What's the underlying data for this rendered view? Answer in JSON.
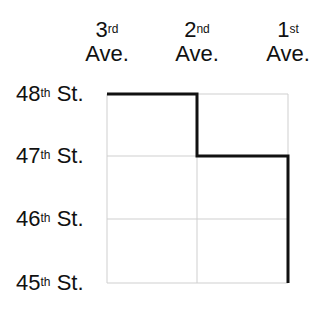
{
  "diagram": {
    "avenues": [
      {
        "num": "3",
        "suffix": "rd",
        "label": "Ave.",
        "x": 107
      },
      {
        "num": "2",
        "suffix": "nd",
        "label": "Ave.",
        "x": 197
      },
      {
        "num": "1",
        "suffix": "st",
        "label": "Ave.",
        "x": 288
      }
    ],
    "streets": [
      {
        "num": "48",
        "suffix": "th",
        "label": "St.",
        "y": 94
      },
      {
        "num": "47",
        "suffix": "th",
        "label": "St.",
        "y": 156
      },
      {
        "num": "46",
        "suffix": "th",
        "label": "St.",
        "y": 219
      },
      {
        "num": "45",
        "suffix": "th",
        "label": "St.",
        "y": 283
      }
    ],
    "route": {
      "description": "Path from 48th St & 3rd Ave to 45th St & 1st Ave",
      "points": [
        [
          107,
          94
        ],
        [
          197,
          94
        ],
        [
          197,
          156
        ],
        [
          288,
          156
        ],
        [
          288,
          283
        ]
      ],
      "color": "#111111"
    },
    "grid_color": "#cfcfcf"
  }
}
